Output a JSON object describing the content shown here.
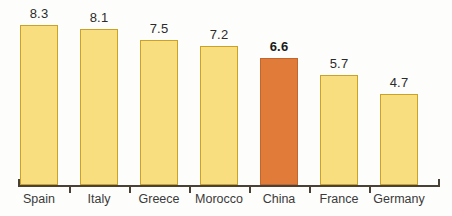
{
  "chart_data": {
    "type": "bar",
    "title": "",
    "subtitle": "",
    "xlabel": "",
    "ylabel": "",
    "categories": [
      "Spain",
      "Italy",
      "Greece",
      "Morocco",
      "China",
      "France",
      "Germany"
    ],
    "values": [
      8.3,
      8.1,
      7.5,
      7.2,
      6.6,
      5.7,
      4.7
    ],
    "value_labels": [
      "8.3",
      "8.1",
      "7.5",
      "7.2",
      "6.6",
      "5.7",
      "4.7"
    ],
    "highlight_index": 4,
    "highlight_category": "China",
    "ylim": [
      0,
      9.5
    ],
    "grid": false,
    "legend": null,
    "axis": {
      "x_axis_visible": true,
      "y_axis_visible": false,
      "tick_marks": "between-categories"
    },
    "colors": {
      "bar_fill": "#F8DE7E",
      "bar_border": "#C9A227",
      "highlight_fill": "#E07B39",
      "highlight_border": "#C2662C",
      "axis": "#4A4136",
      "label_text": "#3A3A3A",
      "value_text": "#2B2B2B",
      "background": "#FDFDFB"
    }
  }
}
